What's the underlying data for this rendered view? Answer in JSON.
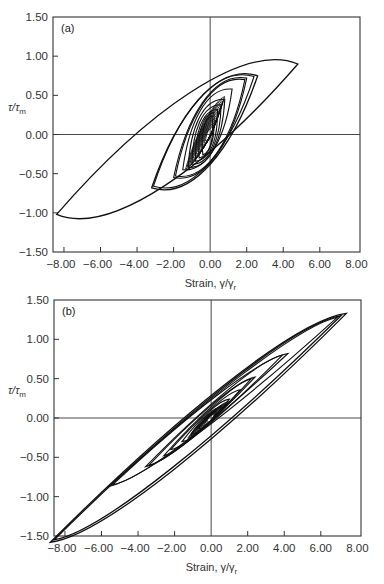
{
  "chart_data": [
    {
      "type": "line",
      "panel_label": "(a)",
      "title": "",
      "xlabel": "Strain, γ/γr",
      "ylabel": "τ/τm",
      "xlim": [
        -8.6,
        8.2
      ],
      "ylim": [
        -1.5,
        1.5
      ],
      "x_ticks": [
        "-8.00",
        "-6.00",
        "-4.00",
        "-2.00",
        "0.00",
        "2.00",
        "4.00",
        "6.00",
        "8.00"
      ],
      "y_ticks": [
        "1.50",
        "1.00",
        "0.50",
        "0.00",
        "-0.50",
        "-1.00",
        "-1.50"
      ],
      "grid": false,
      "zero_lines": true,
      "description": "Hysteresis loops of stress ratio vs strain; large outer loop from (-8.4,-1.02) to (4.8,0.9), nested smaller loops clustered near origin",
      "series": [
        {
          "name": "outer loop",
          "tips": [
            [
              -8.4,
              -1.02
            ],
            [
              4.8,
              0.9
            ]
          ],
          "width": 0.62
        },
        {
          "name": "loop 2",
          "tips": [
            [
              -3.2,
              -0.68
            ],
            [
              2.6,
              0.75
            ]
          ],
          "width": 0.5
        },
        {
          "name": "loop 3",
          "tips": [
            [
              -3.1,
              -0.66
            ],
            [
              2.4,
              0.74
            ]
          ],
          "width": 0.48
        },
        {
          "name": "loop 4",
          "tips": [
            [
              -2.0,
              -0.55
            ],
            [
              2.0,
              0.72
            ]
          ],
          "width": 0.4
        },
        {
          "name": "loop 5",
          "tips": [
            [
              -1.9,
              -0.53
            ],
            [
              1.9,
              0.7
            ]
          ],
          "width": 0.38
        },
        {
          "name": "loop 6",
          "tips": [
            [
              -1.5,
              -0.45
            ],
            [
              1.2,
              0.58
            ]
          ],
          "width": 0.3
        },
        {
          "name": "loop 7",
          "tips": [
            [
              -1.2,
              -0.42
            ],
            [
              0.8,
              0.45
            ]
          ],
          "width": 0.26
        },
        {
          "name": "loop 8",
          "tips": [
            [
              -1.0,
              -0.38
            ],
            [
              0.6,
              0.38
            ]
          ],
          "width": 0.22
        },
        {
          "name": "loop 9",
          "tips": [
            [
              -0.8,
              -0.34
            ],
            [
              0.4,
              0.32
            ]
          ],
          "width": 0.18
        },
        {
          "name": "loop 10",
          "tips": [
            [
              -0.6,
              -0.3
            ],
            [
              0.2,
              0.28
            ]
          ],
          "width": 0.14
        },
        {
          "name": "loop 11",
          "tips": [
            [
              -0.4,
              -0.26
            ],
            [
              0.1,
              0.24
            ]
          ],
          "width": 0.1
        }
      ]
    },
    {
      "type": "line",
      "panel_label": "(b)",
      "title": "",
      "xlabel": "Strain, γ/γr",
      "ylabel": "τ/τm",
      "xlim": [
        -8.6,
        8.2
      ],
      "ylim": [
        -1.5,
        1.5
      ],
      "x_ticks": [
        "-8.00",
        "-6.00",
        "-4.00",
        "-2.00",
        "0.00",
        "2.00",
        "4.00",
        "6.00",
        "8.00"
      ],
      "y_ticks": [
        "1.50",
        "1.00",
        "0.50",
        "0.00",
        "-0.50",
        "-1.00",
        "-1.50"
      ],
      "grid": false,
      "zero_lines": true,
      "description": "Narrow elongated hysteresis loops along a diagonal; outer loop from (-8.8,-1.58) to (7.4,1.33), nested loops shrinking toward origin",
      "series": [
        {
          "name": "outer loop",
          "tips": [
            [
              -8.8,
              -1.58
            ],
            [
              7.4,
              1.33
            ]
          ],
          "width": 0.34
        },
        {
          "name": "loop 2",
          "tips": [
            [
              -8.6,
              -1.55
            ],
            [
              7.1,
              1.3
            ]
          ],
          "width": 0.3
        },
        {
          "name": "loop 3",
          "tips": [
            [
              -5.6,
              -0.87
            ],
            [
              6.9,
              1.28
            ]
          ],
          "width": 0.2
        },
        {
          "name": "loop 4",
          "tips": [
            [
              -5.4,
              -0.85
            ],
            [
              4.2,
              0.82
            ]
          ],
          "width": 0.17
        },
        {
          "name": "loop 5",
          "tips": [
            [
              -3.6,
              -0.62
            ],
            [
              3.9,
              0.8
            ]
          ],
          "width": 0.14
        },
        {
          "name": "loop 6",
          "tips": [
            [
              -3.4,
              -0.6
            ],
            [
              2.4,
              0.52
            ]
          ],
          "width": 0.12
        },
        {
          "name": "loop 7",
          "tips": [
            [
              -2.6,
              -0.48
            ],
            [
              2.2,
              0.5
            ]
          ],
          "width": 0.1
        },
        {
          "name": "loop 8",
          "tips": [
            [
              -2.2,
              -0.4
            ],
            [
              1.6,
              0.36
            ]
          ],
          "width": 0.09
        },
        {
          "name": "loop 9",
          "tips": [
            [
              -1.6,
              -0.3
            ],
            [
              1.0,
              0.24
            ]
          ],
          "width": 0.08
        },
        {
          "name": "loop 10",
          "tips": [
            [
              -1.1,
              -0.2
            ],
            [
              0.6,
              0.14
            ]
          ],
          "width": 0.07
        },
        {
          "name": "loop 11",
          "tips": [
            [
              -0.7,
              -0.13
            ],
            [
              0.3,
              0.08
            ]
          ],
          "width": 0.06
        }
      ]
    }
  ],
  "panels": [
    {
      "id": "a",
      "label": "(a)",
      "ylabel_main": "τ/τ",
      "ylabel_sub": "m",
      "xlabel_main": "Strain, γ/γ",
      "xlabel_sub": "r"
    },
    {
      "id": "b",
      "label": "(b)",
      "ylabel_main": "τ/τ",
      "ylabel_sub": "m",
      "xlabel_main": "Strain, γ/γ",
      "xlabel_sub": "r"
    }
  ],
  "style": {
    "line_color": "#111111",
    "axis_color": "#333333",
    "background": "#ffffff"
  }
}
